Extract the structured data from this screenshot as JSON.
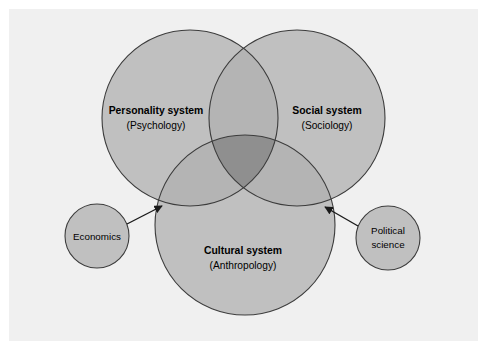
{
  "figure": {
    "kind": "venn-diagram",
    "panel_bg": "#f0f0f0",
    "page_bg": "#ffffff",
    "circle_fill": "#c0c0c0",
    "overlap_fill": "#ababab",
    "triple_overlap_fill": "#8f8f8f",
    "stroke": "#3c3c3c",
    "text_color": "#000000"
  },
  "systems": [
    {
      "id": "personality",
      "title": "Personality system",
      "discipline": "(Psychology)"
    },
    {
      "id": "social",
      "title": "Social system",
      "discipline": "(Sociology)"
    },
    {
      "id": "cultural",
      "title": "Cultural system",
      "discipline": "(Anthropology)"
    }
  ],
  "satellites": [
    {
      "id": "economics",
      "label": "Economics",
      "line1": "Economics",
      "line2": ""
    },
    {
      "id": "political-science",
      "label": "Political science",
      "line1": "Political",
      "line2": "science"
    }
  ],
  "connectors": [
    {
      "id": "economics-arrow",
      "from": "economics",
      "to": "cultural",
      "style": "arrow"
    },
    {
      "id": "political-science-arrow",
      "from": "political-science",
      "to": "cultural",
      "style": "arrow"
    }
  ]
}
